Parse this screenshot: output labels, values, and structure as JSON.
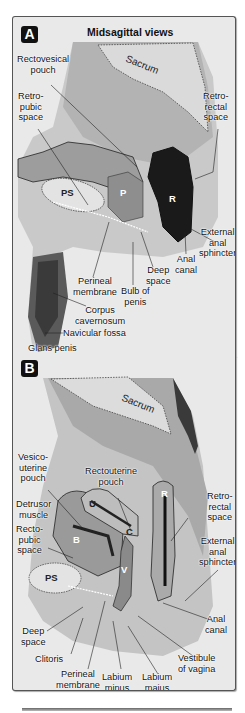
{
  "figure": {
    "title": "Midsagittal views",
    "colors": {
      "background": "#e9e9e9",
      "badge": "#111111",
      "rectum_dark": "#1a1a1a",
      "border": "#555555"
    }
  },
  "panel_a": {
    "badge": "A",
    "sex": "male",
    "organ_letters": {
      "pubic_symphysis": "PS",
      "prostate": "P",
      "rectum": "R"
    },
    "bone_label": "Sacrum",
    "labels": {
      "rectovesical_pouch": [
        "Rectovesical",
        "pouch"
      ],
      "retropubic_space": [
        "Retro-",
        "pubic",
        "space"
      ],
      "retrorectal_space": [
        "Retro-",
        "rectal",
        "space"
      ],
      "external_anal_sphincter": [
        "External",
        "anal",
        "sphincter"
      ],
      "anal_canal": [
        "Anal",
        "canal"
      ],
      "deep_space": [
        "Deep",
        "space"
      ],
      "bulb_of_penis": [
        "Bulb of",
        "penis"
      ],
      "perineal_membrane": [
        "Perineal",
        "membrane"
      ],
      "corpus_cavernosum": [
        "Corpus",
        "cavernosum"
      ],
      "navicular_fossa": "Navicular fossa",
      "glans_penis": "Glans penis"
    }
  },
  "panel_b": {
    "badge": "B",
    "sex": "female",
    "organ_letters": {
      "pubic_symphysis": "PS",
      "bladder": "B",
      "uterus": "U",
      "cervix": "C",
      "vagina": "V",
      "rectum": "R"
    },
    "bone_label": "Sacrum",
    "labels": {
      "vesicouterine_pouch": [
        "Vesico-",
        "uterine",
        "pouch"
      ],
      "rectouterine_pouch": [
        "Rectouterine",
        "pouch"
      ],
      "detrusor_muscle": [
        "Detrusor",
        "muscle"
      ],
      "rectopubic_space": [
        "Recto-",
        "pubic",
        "space"
      ],
      "retrorectal_space": [
        "Retro-",
        "rectal",
        "space"
      ],
      "external_anal_sphincter": [
        "External",
        "anal",
        "sphincter"
      ],
      "anal_canal": [
        "Anal",
        "canal"
      ],
      "deep_space": [
        "Deep",
        "space"
      ],
      "clitoris": "Clitoris",
      "perineal_membrane": [
        "Perineal",
        "membrane"
      ],
      "labium_minus": [
        "Labium",
        "minus"
      ],
      "labium_majus": [
        "Labium",
        "majus"
      ],
      "vestibule_of_vagina": [
        "Vestibule",
        "of vagina"
      ]
    }
  }
}
